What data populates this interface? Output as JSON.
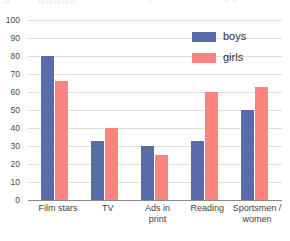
{
  "top_artifact": {
    "glyph_1": "⊡",
    "glyph_2": "▭▭▭▭▭",
    "glyph_3": "▫",
    "glyph_4": "⌐ ⌐"
  },
  "legend": {
    "position": "top-right",
    "entries": [
      {
        "label": "boys",
        "color": "#5a6bab"
      },
      {
        "label": "girls",
        "color": "#fb8380"
      }
    ]
  },
  "chart_data": {
    "type": "bar",
    "title": "",
    "xlabel": "",
    "ylabel": "",
    "ylim": [
      0,
      100
    ],
    "ytick_step": 10,
    "yticks": [
      0,
      10,
      20,
      30,
      40,
      50,
      60,
      70,
      80,
      90,
      100
    ],
    "ytick_labels": [
      "0",
      "10",
      "20",
      "30",
      "40",
      "50",
      "60",
      "70",
      "80",
      "90",
      "100"
    ],
    "grid": true,
    "legend_position": "top-right",
    "categories": [
      "Film stars",
      "TV",
      "Ads in\nprint",
      "Reading",
      "Sportsmen /\nwomen"
    ],
    "series": [
      {
        "name": "boys",
        "color": "#5a6bab",
        "values": [
          80,
          33,
          30,
          33,
          50
        ]
      },
      {
        "name": "girls",
        "color": "#fb8380",
        "values": [
          66,
          40,
          25,
          60,
          63
        ]
      }
    ]
  }
}
